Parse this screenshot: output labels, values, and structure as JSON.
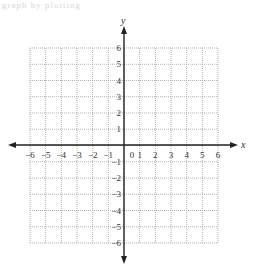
{
  "header": {
    "partial_text": "graph by plotting"
  },
  "chart_data": {
    "type": "scatter",
    "title": "",
    "xlabel": "x",
    "ylabel": "y",
    "xlim": [
      -6,
      6
    ],
    "ylim": [
      -6,
      6
    ],
    "x_ticks": [
      "-6",
      "-5",
      "-4",
      "-3",
      "-2",
      "-1",
      "0",
      "1",
      "2",
      "3",
      "4",
      "5",
      "6"
    ],
    "y_ticks": [
      "6",
      "5",
      "4",
      "3",
      "2",
      "1",
      "-1",
      "-2",
      "-3",
      "-4",
      "-5",
      "-6"
    ],
    "grid": true,
    "grid_style": "dotted",
    "series": []
  },
  "colors": {
    "axis": "#222222",
    "grid": "#b0b0b0",
    "label": "#333333"
  }
}
